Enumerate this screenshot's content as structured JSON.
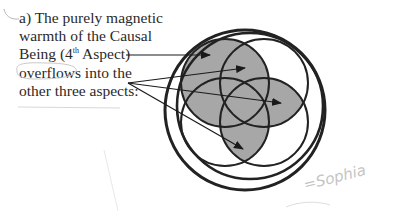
{
  "caption": {
    "line1": "a) The purely magnetic",
    "line2": "warmth of the Causal",
    "line3_pre": "Being (4",
    "line3_sup": "th",
    "line3_post": " Aspect)",
    "line4": "overflows into the",
    "line5": "other three aspects:"
  },
  "annotation": {
    "handwritten": "=Sophia"
  },
  "diagram": {
    "fill_color": "#a7a7a7",
    "stroke_color": "#222222",
    "outer_circle": {
      "label": "Causal Being"
    },
    "inner_circles": [
      "top-left",
      "top-right",
      "bottom-left",
      "bottom-right"
    ],
    "arrows": 4
  }
}
